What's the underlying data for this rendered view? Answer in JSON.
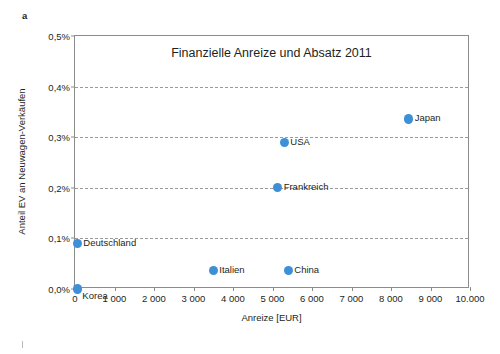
{
  "figure": {
    "panel_label": "a",
    "accent_color": "#3d8fd8",
    "grid_color": "#9a9a9a",
    "axis_color": "#8c8c8c"
  },
  "chart_data": {
    "type": "scatter",
    "title": "Finanzielle Anreize und Absatz 2011",
    "xlabel": "Anreize [EUR]",
    "ylabel": "Anteil EV an Neuwagen-Verkäufen",
    "xlim": [
      0,
      10000
    ],
    "ylim": [
      0,
      0.5
    ],
    "grid": "horizontal-dashed",
    "legend": "none",
    "x_ticks": [
      0,
      1000,
      2000,
      3000,
      4000,
      5000,
      6000,
      7000,
      8000,
      9000,
      10000
    ],
    "x_tick_labels": [
      "0",
      "1 000",
      "2 000",
      "3 000",
      "4 000",
      "5 000",
      "6 000",
      "7 000",
      "8 000",
      "9 000",
      "10.000"
    ],
    "y_ticks": [
      0.0,
      0.1,
      0.2,
      0.3,
      0.4,
      0.5
    ],
    "y_tick_labels": [
      "0,0%",
      "0,1%",
      "0,2%",
      "0,3%",
      "0,4%",
      "0,5%"
    ],
    "y_unit": "percent",
    "points": [
      {
        "label": "Korea",
        "x": 60,
        "y": 0.0,
        "label_position": "below-right"
      },
      {
        "label": "Deutschland",
        "x": 60,
        "y": 0.09,
        "label_position": "right"
      },
      {
        "label": "Italien",
        "x": 3500,
        "y": 0.037,
        "label_position": "right"
      },
      {
        "label": "China",
        "x": 5400,
        "y": 0.037,
        "label_position": "right"
      },
      {
        "label": "Frankreich",
        "x": 5130,
        "y": 0.201,
        "label_position": "right"
      },
      {
        "label": "USA",
        "x": 5300,
        "y": 0.289,
        "label_position": "right"
      },
      {
        "label": "Japan",
        "x": 8450,
        "y": 0.336,
        "label_position": "right"
      }
    ]
  }
}
